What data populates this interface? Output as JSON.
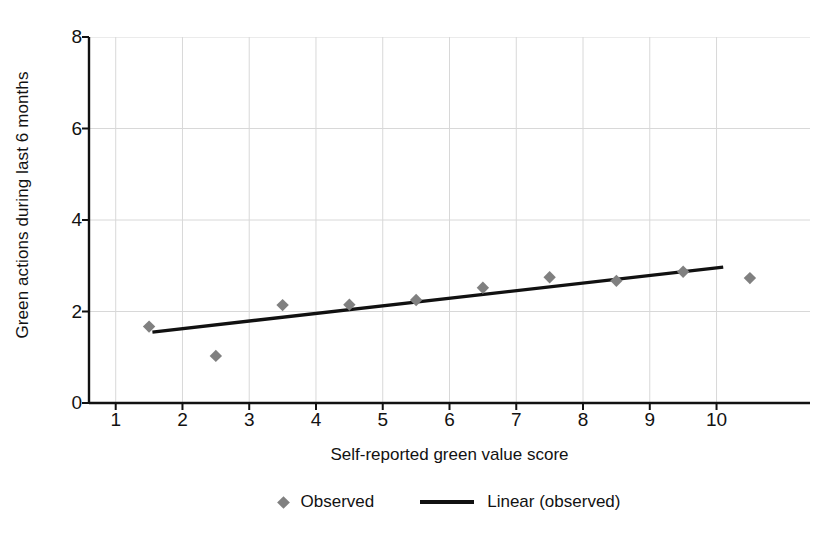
{
  "chart_data": {
    "type": "scatter",
    "title": "",
    "xlabel": "Self-reported green value score",
    "ylabel": "Green actions during last 6 months",
    "xlim": [
      0.6,
      11.4
    ],
    "ylim": [
      0,
      8
    ],
    "xticks": [
      "1",
      "2",
      "3",
      "4",
      "5",
      "6",
      "7",
      "8",
      "9",
      "10"
    ],
    "xtick_values": [
      1,
      2,
      3,
      4,
      5,
      6,
      7,
      8,
      9,
      10
    ],
    "yticks": [
      "0",
      "2",
      "4",
      "6",
      "8"
    ],
    "ytick_values": [
      0,
      2,
      4,
      6,
      8
    ],
    "grid": true,
    "legend_position": "bottom-center",
    "series": [
      {
        "name": "Observed",
        "type": "scatter",
        "marker": "diamond",
        "color": "#808080",
        "x": [
          1.5,
          2.5,
          3.5,
          4.5,
          5.5,
          6.5,
          7.5,
          8.5,
          9.5,
          10.5
        ],
        "values": [
          1.67,
          1.03,
          2.14,
          2.15,
          2.25,
          2.52,
          2.75,
          2.67,
          2.87,
          2.73
        ]
      },
      {
        "name": "Linear (observed)",
        "type": "line",
        "color": "#111111",
        "x": [
          1.55,
          10.1
        ],
        "values": [
          1.55,
          2.97
        ]
      }
    ]
  },
  "legend": {
    "items": [
      {
        "label": "Observed",
        "marker": "diamond",
        "color": "#808080"
      },
      {
        "label": "Linear (observed)",
        "marker": "line",
        "color": "#111111"
      }
    ]
  },
  "colors": {
    "marker": "#808080",
    "trendline": "#111111",
    "gridline": "#d8d8d8",
    "axis": "#111111",
    "text": "#121212",
    "background": "#ffffff"
  }
}
